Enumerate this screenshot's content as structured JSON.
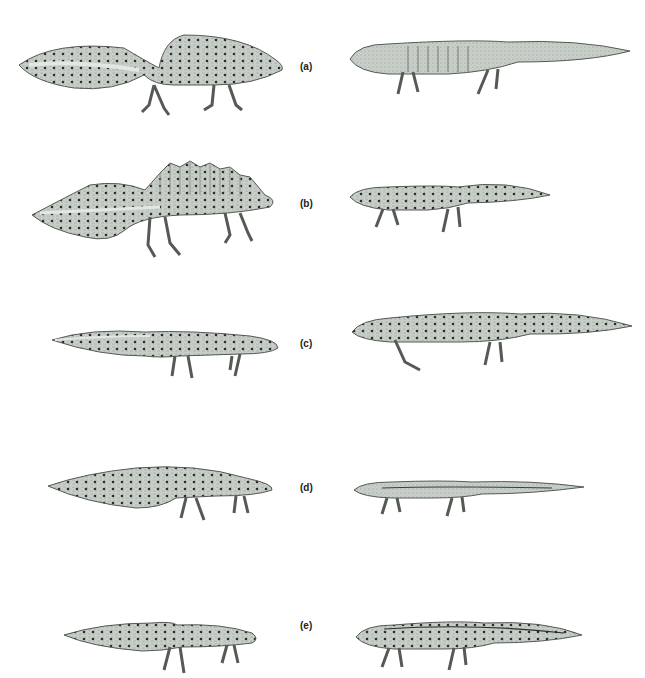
{
  "figure": {
    "rows": [
      {
        "label": "(a)",
        "top": 0
      },
      {
        "label": "(b)",
        "top": 140
      },
      {
        "label": "(c)",
        "top": 280
      },
      {
        "label": "(d)",
        "top": 420
      },
      {
        "label": "(e)",
        "top": 560
      }
    ],
    "colors": {
      "body": "#c9cfc9",
      "body_dark": "#8f958f",
      "outline": "#555a55",
      "spots": "#2a2d2a",
      "belly": "#e3e7e3"
    }
  }
}
